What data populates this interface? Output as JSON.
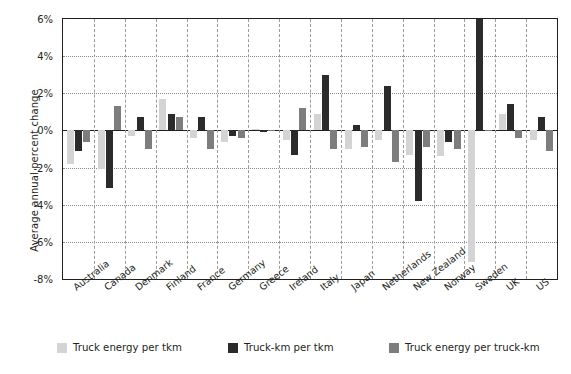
{
  "chart_data": {
    "type": "bar",
    "title": "",
    "xlabel": "",
    "ylabel": "Average annual percent change",
    "ylim": [
      -8,
      6
    ],
    "yticks": [
      "6%",
      "4%",
      "2%",
      "0%",
      "-2%",
      "-4%",
      "-6%",
      "-8%"
    ],
    "ytick_values": [
      6,
      4,
      2,
      0,
      -2,
      -4,
      -6,
      -8
    ],
    "grid": true,
    "legend_position": "bottom",
    "categories": [
      "Australia",
      "Canada",
      "Denmark",
      "Finland",
      "France",
      "Germany",
      "Greece",
      "Ireland",
      "Italy",
      "Japan",
      "Netherlands",
      "New Zealand",
      "Norway",
      "Sweden",
      "UK",
      "US"
    ],
    "series": [
      {
        "name": "Truck energy per tkm",
        "color": "#d4d4d4",
        "values": [
          -1.8,
          -2.1,
          -0.3,
          1.7,
          -0.4,
          -0.6,
          0.1,
          -0.5,
          0.9,
          -1.0,
          -0.5,
          -1.3,
          -1.4,
          -7.1,
          0.9,
          -0.5
        ]
      },
      {
        "name": "Truck-km per tkm",
        "color": "#2b2b2b",
        "values": [
          -1.1,
          -3.1,
          0.7,
          0.9,
          0.7,
          -0.3,
          -0.1,
          -1.3,
          3.0,
          0.3,
          2.4,
          -3.8,
          -0.6,
          6.0,
          1.4,
          0.7
        ]
      },
      {
        "name": "Truck energy per truck-km",
        "color": "#7d7d7d",
        "values": [
          -0.6,
          1.3,
          -1.0,
          0.7,
          -1.0,
          -0.4,
          0.05,
          1.2,
          -1.0,
          -0.9,
          -1.7,
          -0.9,
          -1.0,
          0.0,
          -0.4,
          -1.1
        ]
      }
    ]
  }
}
